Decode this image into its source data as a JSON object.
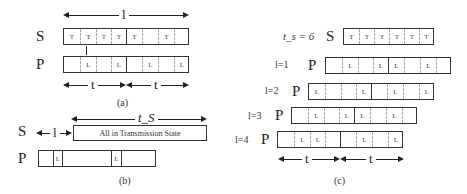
{
  "panel_a": {
    "caption": "(a)",
    "span_label": "l",
    "row_s_label": "S",
    "row_p_label": "P",
    "s_cells": [
      "T",
      "T",
      "T",
      "T",
      "T",
      "",
      "T",
      ""
    ],
    "p_cells": [
      "",
      "L",
      "",
      "L",
      "",
      "L",
      "",
      "L"
    ],
    "t_label_1": "t",
    "t_label_2": "t"
  },
  "panel_b": {
    "caption": "(b)",
    "ts_label": "t_S",
    "row_s_label": "S",
    "row_p_label": "P",
    "offset_label": "l",
    "s_box_text": "All in Transmission State",
    "p_cells": [
      "L",
      "L"
    ]
  },
  "panel_c": {
    "caption": "(c)",
    "ts_label": "t_s = 6",
    "row_s_label": "S",
    "s_cells": [
      "T",
      "T",
      "T",
      "T",
      "T",
      "T"
    ],
    "rows": [
      {
        "label": "l=1",
        "p_label": "P",
        "cells": [
          "",
          "L",
          "",
          "L",
          "L",
          "",
          "L",
          ""
        ]
      },
      {
        "label": "l=2",
        "p_label": "P",
        "cells": [
          "L",
          "",
          "",
          "L",
          "",
          "L",
          "",
          "L"
        ]
      },
      {
        "label": "l=3",
        "p_label": "P",
        "cells": [
          "",
          "L",
          "",
          "L",
          "L",
          "",
          "L",
          ""
        ]
      },
      {
        "label": "l=4",
        "p_label": "P",
        "cells": [
          "",
          "L",
          "L",
          "",
          "",
          "L",
          "",
          "L"
        ]
      }
    ],
    "t_label_1": "t",
    "t_label_2": "t"
  }
}
